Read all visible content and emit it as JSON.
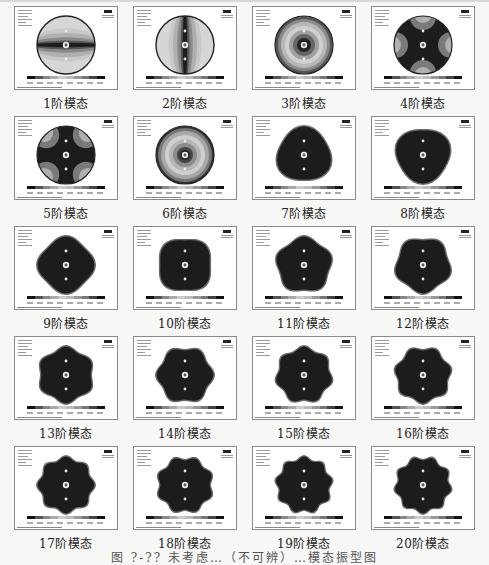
{
  "figure": {
    "caption": "图 ?-?? 未考虑…（不可辨）…模态振型图",
    "caption_legible": false,
    "columns": 4,
    "rows": 5,
    "panels": [
      {
        "label": "1阶模态",
        "pattern": "horizontal-band"
      },
      {
        "label": "2阶模态",
        "pattern": "vertical-band"
      },
      {
        "label": "3阶模态",
        "pattern": "concentric-rings"
      },
      {
        "label": "4阶模态",
        "pattern": "four-lobe-cross"
      },
      {
        "label": "5阶模态",
        "pattern": "four-lobe-cross"
      },
      {
        "label": "6阶模态",
        "pattern": "concentric-rings"
      },
      {
        "label": "7阶模态",
        "pattern": "polygon",
        "sides": 3
      },
      {
        "label": "8阶模态",
        "pattern": "polygon",
        "sides": 3
      },
      {
        "label": "9阶模态",
        "pattern": "polygon",
        "sides": 4
      },
      {
        "label": "10阶模态",
        "pattern": "polygon",
        "sides": 4
      },
      {
        "label": "11阶模态",
        "pattern": "polygon",
        "sides": 5
      },
      {
        "label": "12阶模态",
        "pattern": "polygon",
        "sides": 5
      },
      {
        "label": "13阶模态",
        "pattern": "polygon",
        "sides": 6
      },
      {
        "label": "14阶模态",
        "pattern": "polygon",
        "sides": 6
      },
      {
        "label": "15阶模态",
        "pattern": "polygon",
        "sides": 7
      },
      {
        "label": "16阶模态",
        "pattern": "polygon",
        "sides": 7
      },
      {
        "label": "17阶模态",
        "pattern": "polygon",
        "sides": 8
      },
      {
        "label": "18阶模态",
        "pattern": "polygon",
        "sides": 8
      },
      {
        "label": "19阶模态",
        "pattern": "polygon",
        "sides": 9
      },
      {
        "label": "20阶模态",
        "pattern": "polygon",
        "sides": 9
      }
    ]
  },
  "colors": {
    "deform_dark": "#1c1c1c",
    "ring_mid": "#8a8a8a",
    "ring_light": "#c8c8c8",
    "panel_bg": "#ffffff",
    "page_bg": "#f7f7f5"
  }
}
